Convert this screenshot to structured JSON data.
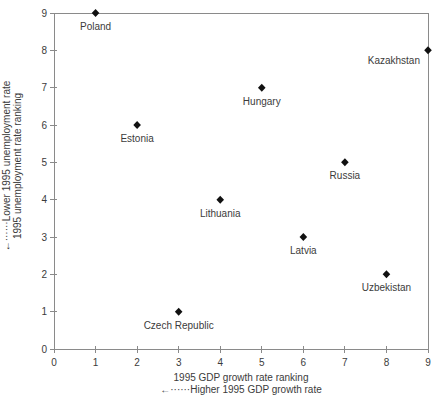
{
  "figure": {
    "background": "#ffffff"
  },
  "chart_data": {
    "type": "scatter",
    "marker": "diamond",
    "title": "",
    "xlabel_line1": "1995 GDP growth rate ranking",
    "xlabel_line2": "←······Higher 1995 GDP growth rate",
    "ylabel_line1": "←······Lower 1995 unemployment rate",
    "ylabel_line2": "1995 unemployment rate ranking",
    "xlim": [
      0,
      9
    ],
    "ylim": [
      0,
      9
    ],
    "xticks": [
      0,
      1,
      2,
      3,
      4,
      5,
      6,
      7,
      8,
      9
    ],
    "yticks": [
      0,
      1,
      2,
      3,
      4,
      5,
      6,
      7,
      8,
      9
    ],
    "grid": false,
    "legend": "none",
    "box": true,
    "colors": {
      "marker": "#111111",
      "axis": "#8a8a8a",
      "text": "#3b3b3b"
    },
    "points": [
      {
        "label": "Poland",
        "x": 1,
        "y": 9
      },
      {
        "label": "Estonia",
        "x": 2,
        "y": 6
      },
      {
        "label": "Czech Republic",
        "x": 3,
        "y": 1
      },
      {
        "label": "Lithuania",
        "x": 4,
        "y": 4
      },
      {
        "label": "Hungary",
        "x": 5,
        "y": 7
      },
      {
        "label": "Latvia",
        "x": 6,
        "y": 3
      },
      {
        "label": "Russia",
        "x": 7,
        "y": 5
      },
      {
        "label": "Uzbekistan",
        "x": 8,
        "y": 2
      },
      {
        "label": "Kazakhstan",
        "x": 9,
        "y": 8,
        "anchor": "end",
        "lx": -8,
        "ly": 14
      }
    ]
  }
}
